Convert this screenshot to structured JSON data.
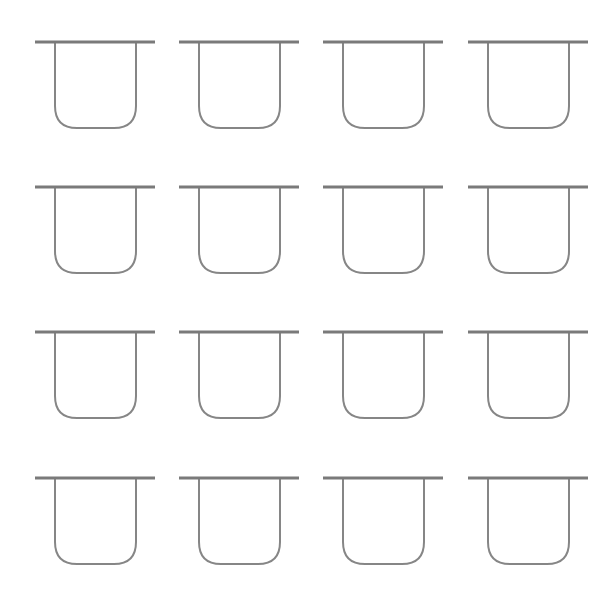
{
  "diagram": {
    "title": "",
    "width": 616,
    "height": 602,
    "background": "#ffffff",
    "rows": 4,
    "columns": 4,
    "shape_type": "u-cup-with-top-bar",
    "style": {
      "bar_color": "#7a7a7a",
      "bar_thickness": 3,
      "wall_color": "#868686",
      "wall_thickness": 2,
      "corner_radius": 22
    },
    "geometry": {
      "bar_length": 120,
      "wall_inset_left": 20,
      "wall_inset_right": 19,
      "cup_depth": 86
    },
    "column_x": [
      35,
      179,
      323,
      468
    ],
    "row_y": [
      42,
      187,
      332,
      478
    ],
    "cells": [
      {
        "row": 0,
        "col": 0
      },
      {
        "row": 0,
        "col": 1
      },
      {
        "row": 0,
        "col": 2
      },
      {
        "row": 0,
        "col": 3
      },
      {
        "row": 1,
        "col": 0
      },
      {
        "row": 1,
        "col": 1
      },
      {
        "row": 1,
        "col": 2
      },
      {
        "row": 1,
        "col": 3
      },
      {
        "row": 2,
        "col": 0
      },
      {
        "row": 2,
        "col": 1
      },
      {
        "row": 2,
        "col": 2
      },
      {
        "row": 2,
        "col": 3
      },
      {
        "row": 3,
        "col": 0
      },
      {
        "row": 3,
        "col": 1
      },
      {
        "row": 3,
        "col": 2
      },
      {
        "row": 3,
        "col": 3
      }
    ]
  }
}
